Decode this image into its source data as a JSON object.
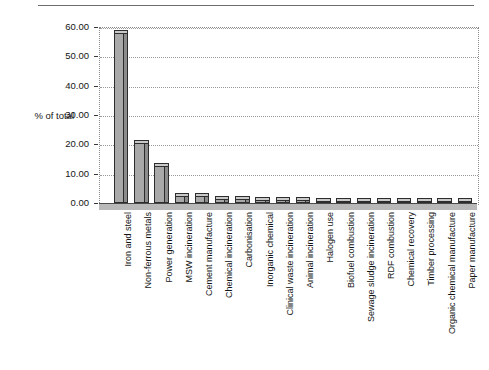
{
  "chart": {
    "type": "bar",
    "title": "",
    "axis_label": "% of total"
  },
  "chart_data": {
    "type": "bar",
    "title": "",
    "subtitle": "",
    "xlabel": "",
    "ylabel": "% of total",
    "ylim": [
      0,
      60
    ],
    "ytick_step": 10,
    "grid": true,
    "legend": false,
    "categories": [
      "Iron and steel",
      "Non-ferrous metals",
      "Power generation",
      "MSW incineration",
      "Cement manufacture",
      "Chemical incineration",
      "Carbonisation",
      "Inorganic chemical",
      "Clinical waste incineration",
      "Animal incineration",
      "Halogen use",
      "Biofuel combustion",
      "Sewage sludge incineration",
      "RDF combustion",
      "Chemical recovery",
      "Timber processing",
      "Organic chemical manufacture",
      "Paper manufacture"
    ],
    "values": [
      58.0,
      20.5,
      12.5,
      2.3,
      2.3,
      1.4,
      1.3,
      1.0,
      1.0,
      0.9,
      0.8,
      0.7,
      0.6,
      0.5,
      0.5,
      0.4,
      0.4,
      0.3
    ],
    "ytick_labels": [
      "0.00",
      "10.00",
      "20.00",
      "30.00",
      "40.00",
      "50.00",
      "60.00"
    ],
    "yticks": [
      0,
      10,
      20,
      30,
      40,
      50,
      60
    ]
  },
  "colors": {
    "bar_face": "#a9a9a9",
    "bar_side": "#8c8c8c",
    "bar_top": "#c9c9c9",
    "bar_outline": "#2d2d2d",
    "grid": "#9a9a9a",
    "wall": "#d6d6d6",
    "floor": "#b9b9b9",
    "text": "#141414"
  }
}
